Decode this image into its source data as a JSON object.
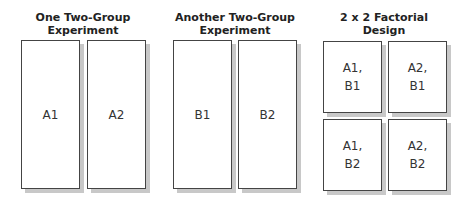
{
  "panels": [
    {
      "title_line1": "One Two-Group",
      "title_line2": "Experiment",
      "cells": [
        "A1",
        "A2"
      ]
    },
    {
      "title_line1": "Another Two-Group",
      "title_line2": "Experiment",
      "cells": [
        "B1",
        "B2"
      ]
    },
    {
      "title_line1": "2 x 2 Factorial",
      "title_line2": "Design",
      "cells": [
        "A1,\nB1",
        "A2,\nB1",
        "A1,\nB2",
        "A2,\nB2"
      ]
    }
  ],
  "colors": {
    "border": "#444444",
    "shadow": "#c8c8c8",
    "text": "#333333"
  }
}
